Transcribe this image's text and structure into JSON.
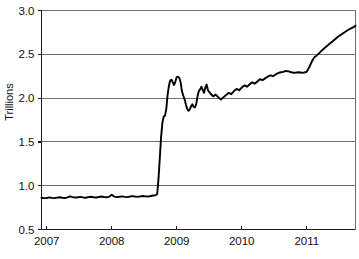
{
  "chart_data": {
    "type": "line",
    "title": "",
    "subtitle": "",
    "xlabel": "",
    "ylabel": "Trillions",
    "xlim": [
      2006.92,
      2011.75
    ],
    "ylim": [
      0.5,
      3.0
    ],
    "grid": true,
    "legend": false,
    "legend_position": "none",
    "x_ticks": [
      2007,
      2008,
      2009,
      2010,
      2011
    ],
    "x_tick_labels": [
      "2007",
      "2008",
      "2009",
      "2010",
      "2011"
    ],
    "y_ticks": [
      0.5,
      1.0,
      1.5,
      2.0,
      2.5,
      3.0
    ],
    "y_tick_labels": [
      "0.5",
      "1.0",
      "1.5",
      "2.0",
      "2.5",
      "3.0"
    ],
    "line_color": "#000000",
    "grid_color": "#6e6e6e",
    "axis_color": "#1a1a1a",
    "series": [
      {
        "name": "Total",
        "x": [
          2006.92,
          2006.96,
          2007.0,
          2007.04,
          2007.08,
          2007.12,
          2007.16,
          2007.2,
          2007.24,
          2007.28,
          2007.32,
          2007.36,
          2007.4,
          2007.44,
          2007.48,
          2007.52,
          2007.56,
          2007.6,
          2007.64,
          2007.68,
          2007.72,
          2007.76,
          2007.8,
          2007.84,
          2007.88,
          2007.92,
          2007.96,
          2008.0,
          2008.04,
          2008.08,
          2008.12,
          2008.16,
          2008.2,
          2008.24,
          2008.28,
          2008.32,
          2008.36,
          2008.4,
          2008.44,
          2008.48,
          2008.52,
          2008.56,
          2008.6,
          2008.64,
          2008.68,
          2008.7,
          2008.72,
          2008.74,
          2008.76,
          2008.78,
          2008.8,
          2008.82,
          2008.84,
          2008.86,
          2008.88,
          2008.9,
          2008.92,
          2008.94,
          2008.96,
          2008.98,
          2009.0,
          2009.02,
          2009.04,
          2009.06,
          2009.08,
          2009.1,
          2009.12,
          2009.14,
          2009.16,
          2009.18,
          2009.2,
          2009.22,
          2009.24,
          2009.26,
          2009.28,
          2009.3,
          2009.32,
          2009.34,
          2009.36,
          2009.38,
          2009.4,
          2009.42,
          2009.44,
          2009.46,
          2009.48,
          2009.52,
          2009.56,
          2009.6,
          2009.64,
          2009.68,
          2009.72,
          2009.76,
          2009.8,
          2009.84,
          2009.88,
          2009.92,
          2009.96,
          2010.0,
          2010.04,
          2010.08,
          2010.12,
          2010.16,
          2010.2,
          2010.24,
          2010.28,
          2010.32,
          2010.36,
          2010.4,
          2010.44,
          2010.48,
          2010.52,
          2010.56,
          2010.6,
          2010.64,
          2010.68,
          2010.72,
          2010.76,
          2010.8,
          2010.84,
          2010.88,
          2010.92,
          2010.96,
          2011.0,
          2011.04,
          2011.08,
          2011.12,
          2011.16,
          2011.2,
          2011.24,
          2011.28,
          2011.32,
          2011.36,
          2011.4,
          2011.44,
          2011.48,
          2011.52,
          2011.56,
          2011.6,
          2011.64,
          2011.68,
          2011.72,
          2011.75
        ],
        "values": [
          0.862,
          0.858,
          0.86,
          0.866,
          0.861,
          0.858,
          0.864,
          0.868,
          0.862,
          0.859,
          0.866,
          0.878,
          0.87,
          0.865,
          0.868,
          0.872,
          0.866,
          0.863,
          0.869,
          0.874,
          0.869,
          0.866,
          0.871,
          0.876,
          0.871,
          0.868,
          0.873,
          0.898,
          0.876,
          0.87,
          0.874,
          0.878,
          0.873,
          0.87,
          0.876,
          0.881,
          0.876,
          0.872,
          0.878,
          0.883,
          0.878,
          0.876,
          0.882,
          0.888,
          0.892,
          0.905,
          1.08,
          1.32,
          1.56,
          1.72,
          1.79,
          1.8,
          1.88,
          2.04,
          2.14,
          2.2,
          2.21,
          2.18,
          2.15,
          2.19,
          2.24,
          2.245,
          2.23,
          2.18,
          2.08,
          2.03,
          1.99,
          1.93,
          1.88,
          1.855,
          1.87,
          1.905,
          1.93,
          1.9,
          1.895,
          1.93,
          2.02,
          2.08,
          2.1,
          2.13,
          2.095,
          2.06,
          2.12,
          2.155,
          2.09,
          2.05,
          2.02,
          2.04,
          2.01,
          1.985,
          2.01,
          2.035,
          2.06,
          2.045,
          2.08,
          2.105,
          2.09,
          2.12,
          2.145,
          2.13,
          2.155,
          2.18,
          2.165,
          2.19,
          2.215,
          2.205,
          2.225,
          2.245,
          2.26,
          2.25,
          2.27,
          2.285,
          2.295,
          2.3,
          2.31,
          2.305,
          2.295,
          2.29,
          2.292,
          2.295,
          2.29,
          2.292,
          2.3,
          2.355,
          2.42,
          2.47,
          2.49,
          2.52,
          2.55,
          2.575,
          2.6,
          2.625,
          2.65,
          2.675,
          2.7,
          2.72,
          2.74,
          2.76,
          2.78,
          2.795,
          2.81,
          2.825
        ]
      }
    ],
    "annotations": []
  }
}
